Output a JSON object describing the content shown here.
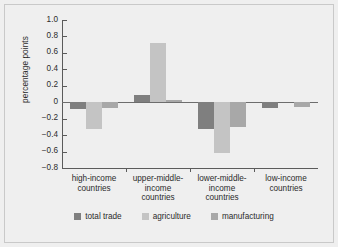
{
  "chart_data": {
    "type": "bar",
    "title": "",
    "xlabel": "",
    "ylabel": "percentage points",
    "ylim": [
      -0.8,
      1.0
    ],
    "yticks": [
      "1.0",
      "0.8",
      "0.6",
      "0.4",
      "0.2",
      "0",
      "−0.2",
      "−0.4",
      "−0.6",
      "−0.8"
    ],
    "ytick_values": [
      1.0,
      0.8,
      0.6,
      0.4,
      0.2,
      0,
      -0.2,
      -0.4,
      -0.6,
      -0.8
    ],
    "grid": false,
    "legend_position": "bottom",
    "categories": [
      "high-income countries",
      "upper-middle-income countries",
      "lower-middle-income countries",
      "low-income countries"
    ],
    "category_lines": [
      [
        "high-income",
        "countries"
      ],
      [
        "upper-middle-",
        "income",
        "countries"
      ],
      [
        "lower-middle-",
        "income",
        "countries"
      ],
      [
        "low-income",
        "countries"
      ]
    ],
    "series": [
      {
        "name": "total trade",
        "color": "#7f7f7f",
        "values": [
          -0.08,
          0.09,
          -0.33,
          -0.07
        ]
      },
      {
        "name": "agriculture",
        "color": "#c4c4c4",
        "values": [
          -0.33,
          0.72,
          -0.62,
          0.0
        ]
      },
      {
        "name": "manufacturing",
        "color": "#a8a8a8",
        "values": [
          -0.07,
          0.03,
          -0.3,
          -0.06
        ]
      }
    ]
  },
  "colors": {
    "background": "#efefef",
    "frame": "#c9c9c9",
    "axis": "#5b5b5b",
    "text": "#2b2b2b",
    "total_trade": "#7f7f7f",
    "agriculture": "#c4c4c4",
    "manufacturing": "#a8a8a8"
  }
}
